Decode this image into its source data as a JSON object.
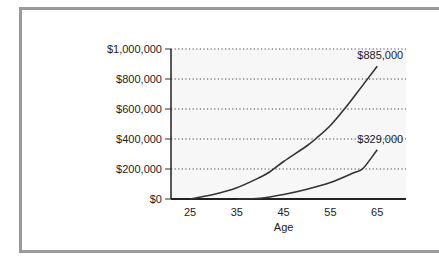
{
  "chart_data": {
    "type": "line",
    "title": "",
    "xlabel": "Age",
    "ylabel": "",
    "x_ticks": [
      25,
      35,
      45,
      55,
      65
    ],
    "y_ticks": [
      0,
      200000,
      400000,
      600000,
      800000,
      1000000
    ],
    "y_tick_labels": [
      "$0",
      "$200,000",
      "$400,000",
      "$600,000",
      "$800,000",
      "$1,000,000"
    ],
    "xlim": [
      21,
      71
    ],
    "ylim": [
      0,
      1000000
    ],
    "grid": "horizontal dotted",
    "legend": "none",
    "series": [
      {
        "name": "Start at 25",
        "x": [
          25,
          30,
          35,
          40,
          42,
          45,
          50,
          52,
          55,
          58,
          60,
          65
        ],
        "values": [
          0,
          30000,
          75000,
          145000,
          180000,
          250000,
          355000,
          405000,
          490000,
          600000,
          680000,
          885000
        ],
        "end_label": "$885,000"
      },
      {
        "name": "Start at 35",
        "x": [
          35,
          40,
          45,
          50,
          55,
          60,
          62,
          65
        ],
        "values": [
          0,
          5000,
          30000,
          65000,
          110000,
          175000,
          205000,
          329000
        ],
        "end_label": "$329,000"
      }
    ],
    "annotations": [
      "$885,000",
      "$329,000"
    ]
  },
  "colors": {
    "frame": "#9a9a9a",
    "plot_bg": "#f7f7f7",
    "line": "#333333",
    "grid": "#444444"
  }
}
